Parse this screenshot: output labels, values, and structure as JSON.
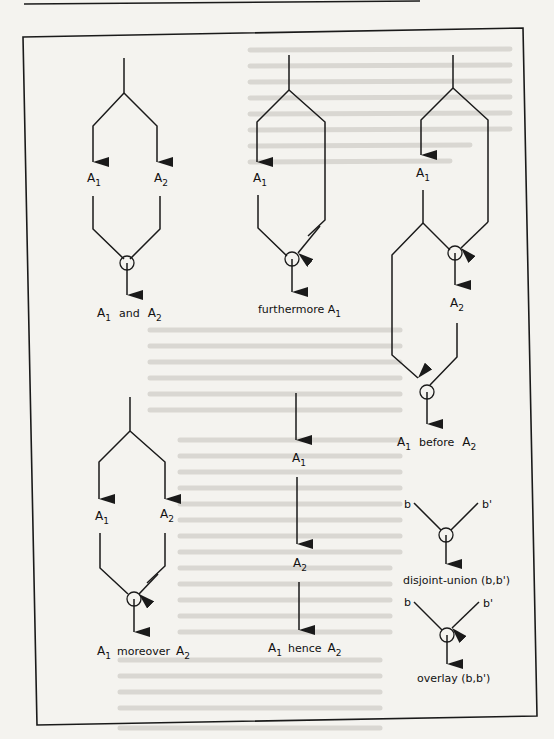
{
  "figure": {
    "diagrams": [
      {
        "id": "and",
        "operands": [
          "A",
          "A"
        ],
        "subs": [
          "1",
          "2"
        ],
        "caption_word": "and",
        "caption_parts": [
          "A",
          "1",
          "and",
          "A",
          "2"
        ]
      },
      {
        "id": "furthermore",
        "caption_parts": [
          "furthermore A",
          "1"
        ],
        "node": {
          "base": "A",
          "sub": "1"
        }
      },
      {
        "id": "before",
        "nodes": [
          {
            "base": "A",
            "sub": "1"
          },
          {
            "base": "A",
            "sub": "2"
          }
        ],
        "caption_parts": [
          "A",
          "1",
          "before",
          "A",
          "2"
        ]
      },
      {
        "id": "moreover",
        "operands": [
          "A",
          "A"
        ],
        "subs": [
          "1",
          "2"
        ],
        "caption_parts": [
          "A",
          "1",
          "moreover",
          "A",
          "2"
        ]
      },
      {
        "id": "hence",
        "nodes": [
          {
            "base": "A",
            "sub": "1"
          },
          {
            "base": "A",
            "sub": "2"
          }
        ],
        "caption_parts": [
          "A",
          "1",
          "hence",
          "A",
          "2"
        ]
      },
      {
        "id": "disjoint-union",
        "inputs": [
          "b",
          "b'"
        ],
        "caption": "disjoint-union (b,b')"
      },
      {
        "id": "overlay",
        "inputs": [
          "b",
          "b'"
        ],
        "caption": "overlay (b,b')"
      }
    ]
  },
  "labels": {
    "A": "A",
    "s1": "1",
    "s2": "2",
    "and": "and",
    "furthermore": "furthermore A",
    "before": "before",
    "moreover": "moreover",
    "hence": "hence",
    "b": "b",
    "bp": "b'",
    "disjoint_union": "disjoint-union (b,b')",
    "overlay": "overlay (b,b')"
  }
}
